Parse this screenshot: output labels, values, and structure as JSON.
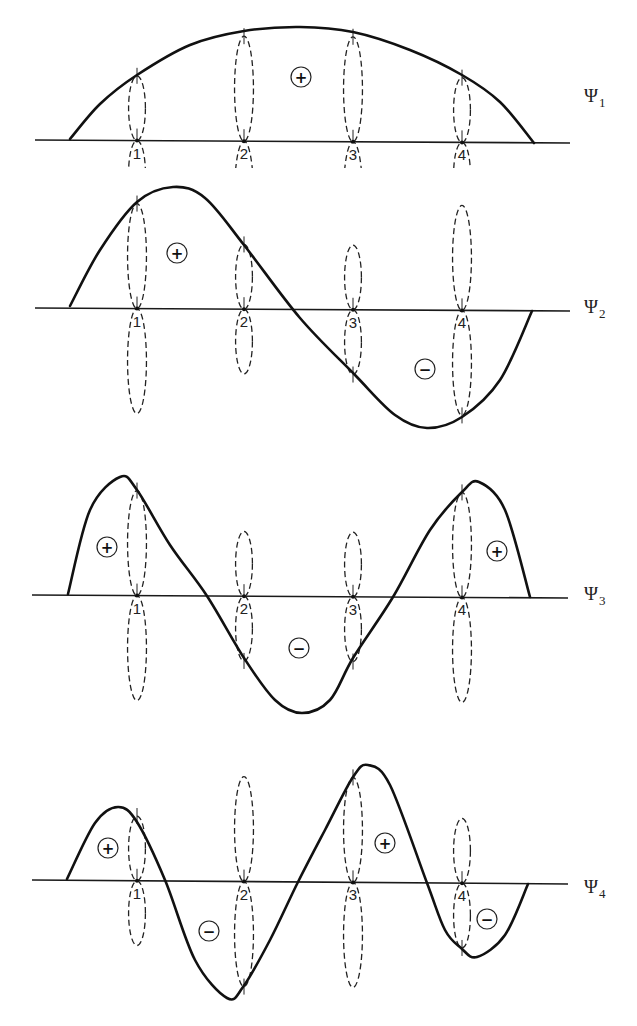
{
  "figure": {
    "atom_labels": [
      "1",
      "2",
      "3",
      "4"
    ],
    "orbitals": [
      {
        "name": "psi-1",
        "symbol": "Ψ",
        "subscript": "1",
        "coefficients": [
          0.37,
          0.6,
          0.6,
          0.37
        ],
        "region_signs": [
          "+"
        ]
      },
      {
        "name": "psi-2",
        "symbol": "Ψ",
        "subscript": "2",
        "coefficients": [
          0.6,
          0.37,
          -0.37,
          -0.6
        ],
        "region_signs": [
          "+",
          "−"
        ]
      },
      {
        "name": "psi-3",
        "symbol": "Ψ",
        "subscript": "3",
        "coefficients": [
          0.6,
          -0.37,
          -0.37,
          0.6
        ],
        "region_signs": [
          "+",
          "−",
          "+"
        ]
      },
      {
        "name": "psi-4",
        "symbol": "Ψ",
        "subscript": "4",
        "coefficients": [
          0.37,
          -0.6,
          0.6,
          -0.37
        ],
        "region_signs": [
          "+",
          "−",
          "+",
          "−"
        ]
      }
    ]
  }
}
